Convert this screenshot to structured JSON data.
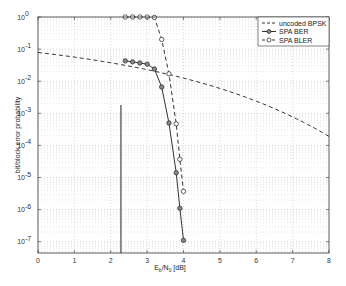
{
  "chart_data": {
    "type": "line",
    "title": "",
    "xlabel": "E_b/N_0 [dB]",
    "ylabel": "bit/block error probability",
    "xlim": [
      0,
      8
    ],
    "ylim": [
      4.5e-08,
      1
    ],
    "yscale": "log",
    "grid": true,
    "legend_position": "upper right",
    "x_ticks": [
      "0",
      "1",
      "2",
      "3",
      "4",
      "5",
      "6",
      "7",
      "8"
    ],
    "y_ticks": [
      "10^0",
      "10^-1",
      "10^-2",
      "10^-3",
      "10^-4",
      "10^-5",
      "10^-6",
      "10^-7"
    ],
    "series": [
      {
        "name": "uncoded BPSK",
        "style": "dashed",
        "marker": "none",
        "x": [
          0,
          1,
          2,
          3,
          4,
          5,
          6,
          7,
          8
        ],
        "y": [
          0.0786,
          0.0563,
          0.0375,
          0.0229,
          0.0125,
          0.00595,
          0.00239,
          0.000773,
          0.000191
        ]
      },
      {
        "name": "SPA BER",
        "style": "solid",
        "marker": "filled-circle",
        "x": [
          2.4,
          2.6,
          2.8,
          3.0,
          3.2,
          3.4,
          3.6,
          3.8,
          3.9,
          4.0
        ],
        "y": [
          0.043,
          0.04,
          0.037,
          0.034,
          0.024,
          0.0066,
          0.0005,
          1.4e-05,
          1.1e-06,
          1.1e-07
        ]
      },
      {
        "name": "SPA BLER",
        "style": "dashed",
        "marker": "open-circle",
        "x": [
          2.4,
          2.6,
          2.8,
          3.0,
          3.2,
          3.4,
          3.6,
          3.8,
          3.9,
          4.0
        ],
        "y": [
          1.0,
          1.0,
          1.0,
          1.0,
          0.97,
          0.2,
          0.017,
          0.00047,
          3.7e-05,
          3.7e-06
        ]
      }
    ],
    "annotations": [
      {
        "type": "vertical-line",
        "x": 2.28,
        "y_from": 0.0018,
        "y_to": 4.5e-08
      }
    ]
  },
  "labels": {
    "xlabel_main": "E",
    "xlabel_sub1": "b",
    "xlabel_mid": "/N",
    "xlabel_sub2": "0",
    "xlabel_end": " [dB]",
    "ylabel": "bit/block error probability",
    "legend": [
      "uncoded BPSK",
      "SPA BER",
      "SPA BLER"
    ]
  }
}
